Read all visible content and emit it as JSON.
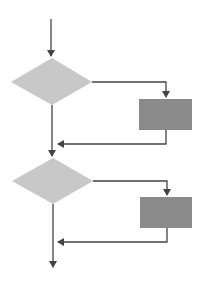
{
  "diagram": {
    "type": "flowchart",
    "colors": {
      "background": "#ffffff",
      "decision_fill": "#c8c8c8",
      "process_fill": "#8a8a8a",
      "line": "#444444"
    },
    "nodes": [
      {
        "id": "decision-1",
        "shape": "diamond",
        "label": ""
      },
      {
        "id": "process-1",
        "shape": "rectangle",
        "label": ""
      },
      {
        "id": "decision-2",
        "shape": "diamond",
        "label": ""
      },
      {
        "id": "process-2",
        "shape": "rectangle",
        "label": ""
      }
    ],
    "edges": [
      {
        "from": "start",
        "to": "decision-1"
      },
      {
        "from": "decision-1",
        "to": "process-1"
      },
      {
        "from": "process-1",
        "to": "main-flow-1"
      },
      {
        "from": "decision-1",
        "to": "decision-2"
      },
      {
        "from": "decision-2",
        "to": "process-2"
      },
      {
        "from": "process-2",
        "to": "main-flow-2"
      },
      {
        "from": "decision-2",
        "to": "end"
      }
    ]
  }
}
